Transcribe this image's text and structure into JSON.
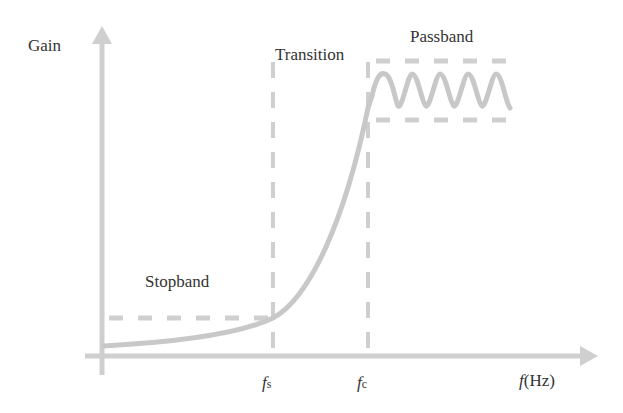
{
  "diagram": {
    "y_axis_label": "Gain",
    "x_axis_label": {
      "symbol": "f",
      "unit": "(Hz)"
    },
    "regions": {
      "stopband": "Stopband",
      "transition": "Transition",
      "passband": "Passband"
    },
    "markers": {
      "fs": {
        "symbol": "f",
        "subscript": "s"
      },
      "fc": {
        "symbol": "f",
        "subscript": "c"
      }
    },
    "colors": {
      "line": "#c8c8c8",
      "text": "#333333",
      "background": "#ffffff"
    }
  }
}
